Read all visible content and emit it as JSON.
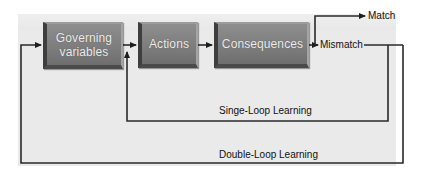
{
  "diagram": {
    "nodes": [
      {
        "id": "governing",
        "label_line1": "Governing",
        "label_line2": "variables"
      },
      {
        "id": "actions",
        "label": "Actions"
      },
      {
        "id": "consequences",
        "label": "Consequences"
      }
    ],
    "outcomes": {
      "match": "Match",
      "mismatch": "Mismatch"
    },
    "loops": {
      "single": "Singe-Loop Learning",
      "double": "Double-Loop Learning"
    },
    "edges": [
      {
        "from": "governing",
        "to": "actions"
      },
      {
        "from": "actions",
        "to": "consequences"
      },
      {
        "from": "consequences",
        "to": "mismatch"
      },
      {
        "from": "consequences",
        "to": "match"
      },
      {
        "from": "mismatch",
        "to": "actions",
        "label": "Singe-Loop Learning"
      },
      {
        "from": "mismatch",
        "to": "governing",
        "label": "Double-Loop Learning"
      }
    ],
    "colors": {
      "panel": "#eaeaea",
      "box_fill": "#7e7e7e",
      "box_text": "#ececec",
      "line": "#2a2a2a"
    }
  }
}
